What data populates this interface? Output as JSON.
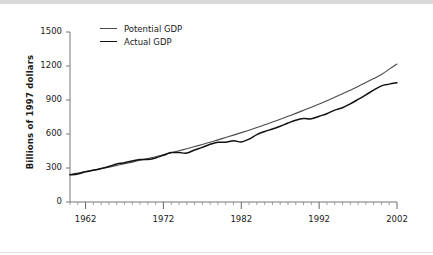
{
  "chart_data": {
    "type": "line",
    "title": "",
    "subtitle": "",
    "xlabel": "",
    "ylabel": "Billions of 1997 dollars",
    "xlim": [
      1960,
      2002
    ],
    "ylim": [
      0,
      1500
    ],
    "yticks": [
      0,
      300,
      600,
      900,
      1200,
      1500
    ],
    "ytick_labels": [
      "0",
      "300",
      "600",
      "900",
      "1200",
      "1500"
    ],
    "xticks": [
      1962,
      1972,
      1982,
      1992,
      2002
    ],
    "xtick_labels": [
      "1962",
      "1972",
      "1982",
      "1992",
      "2002"
    ],
    "minor_xtick_interval": 1,
    "grid": false,
    "legend_position": "top-left-inside",
    "x": [
      1960,
      1961,
      1962,
      1963,
      1964,
      1965,
      1966,
      1967,
      1968,
      1969,
      1970,
      1971,
      1972,
      1973,
      1974,
      1975,
      1976,
      1977,
      1978,
      1979,
      1980,
      1981,
      1982,
      1983,
      1984,
      1985,
      1986,
      1987,
      1988,
      1989,
      1990,
      1991,
      1992,
      1993,
      1994,
      1995,
      1996,
      1997,
      1998,
      1999,
      2000,
      2001,
      2002
    ],
    "series": [
      {
        "name": "Potential GDP",
        "color": "#4a4a4a",
        "values": [
          242,
          255,
          268,
          281,
          294,
          308,
          322,
          337,
          352,
          368,
          384,
          400,
          417,
          434,
          452,
          470,
          489,
          508,
          528,
          548,
          569,
          590,
          612,
          634,
          657,
          681,
          705,
          730,
          756,
          782,
          809,
          837,
          865,
          894,
          924,
          955,
          987,
          1020,
          1054,
          1089,
          1125,
          1172,
          1218
        ]
      },
      {
        "name": "Actual GDP",
        "color": "#111111",
        "values": [
          240,
          248,
          266,
          280,
          296,
          314,
          335,
          346,
          362,
          374,
          376,
          389,
          412,
          436,
          436,
          432,
          459,
          482,
          509,
          527,
          527,
          540,
          530,
          555,
          595,
          622,
          644,
          669,
          697,
          722,
          736,
          734,
          757,
          779,
          811,
          832,
          866,
          905,
          945,
          988,
          1025,
          1040,
          1052
        ]
      }
    ]
  },
  "axes": {
    "y_axis_title": "Billions of 1997 dollars"
  },
  "legend": {
    "items": [
      {
        "label": "Potential GDP",
        "key": "potential"
      },
      {
        "label": "Actual GDP",
        "key": "actual"
      }
    ]
  }
}
